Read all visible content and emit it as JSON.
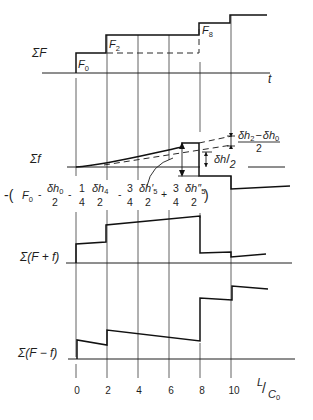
{
  "figure": {
    "panels": {
      "sum_F": {
        "label": "ΣF",
        "axis_label": "t"
      },
      "sum_f": {
        "label": "Σf"
      },
      "sum_F_plus_f": {
        "label": "Σ(F + f)"
      },
      "sum_F_minus_f": {
        "label": "Σ(F − f)"
      }
    },
    "step_labels": [
      {
        "base": "F",
        "sub": "0"
      },
      {
        "base": "F",
        "sub": "2"
      },
      {
        "base": "F",
        "sub": "8"
      }
    ],
    "annotations": {
      "delta_h_half": {
        "num": "δh",
        "den": "2"
      },
      "delta_h_diff": {
        "a": "δh",
        "a_sub": "2",
        "minus": "−",
        "b": "δh",
        "b_sub": "0",
        "den": "2"
      }
    },
    "formula": {
      "open": "-(",
      "F": "F",
      "F_sub": "0",
      "op1": "-",
      "t1_num": "δh",
      "t1_num_sub": "0",
      "t1_den": "2",
      "op2": "-",
      "c2_num": "1",
      "c2_den": "4",
      "t2_num": "δh",
      "t2_num_sub": "4",
      "t2_den": "2",
      "op3": "-",
      "c3_num": "3",
      "c3_den": "4",
      "t3_num": "δh′",
      "t3_num_sub": "5",
      "t3_den": "2",
      "op4": "+",
      "c4_num": "3",
      "c4_den": "4",
      "t4_num": "δh″",
      "t4_num_sub": "5",
      "t4_den": "2",
      "close": ")"
    },
    "x_axis": {
      "ticks": [
        "0",
        "2",
        "4",
        "6",
        "8",
        "10"
      ],
      "label_num": "L",
      "label_slash": "/",
      "label_den": "C",
      "label_den_sub": "0"
    }
  }
}
